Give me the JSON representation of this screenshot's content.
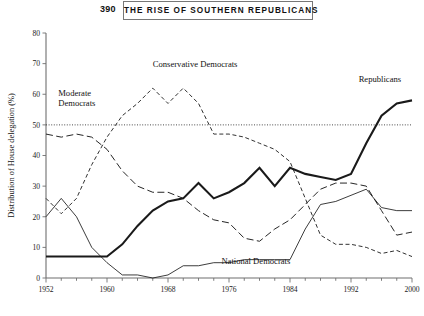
{
  "page": {
    "folio": "390",
    "running_title": "THE RISE OF SOUTHERN REPUBLICANS"
  },
  "chart_data": {
    "type": "line",
    "title": "",
    "xlabel": "",
    "ylabel": "Distribution of House delegation (%)",
    "xlim": [
      1952,
      2000
    ],
    "ylim": [
      0,
      80
    ],
    "grid": false,
    "legend_position": "inline-annotations",
    "xticks": [
      1952,
      1960,
      1968,
      1976,
      1984,
      1992,
      2000
    ],
    "xtick_labels": [
      "1952",
      "1960",
      "1968",
      "1976",
      "1984",
      "1992",
      "2000"
    ],
    "xminor_tick_step": 2,
    "yticks": [
      0,
      10,
      20,
      30,
      40,
      50,
      60,
      70,
      80
    ],
    "ytick_labels": [
      "0",
      "10",
      "20",
      "30",
      "40",
      "50",
      "60",
      "70",
      "80"
    ],
    "reference_lines": [
      {
        "name": "fifty-percent-line",
        "axis": "y",
        "value": 50,
        "style": "dotted"
      }
    ],
    "annotations": [
      {
        "name": "moderate-democrats-label",
        "text": "Moderate\nDemocrats",
        "x": 1953.6,
        "y": 59.5
      },
      {
        "name": "conservative-democrats-label",
        "text": "Conservative Democrats",
        "x": 1966.0,
        "y": 69.0
      },
      {
        "name": "republicans-label",
        "text": "Republicans",
        "x": 1993.0,
        "y": 64.0
      },
      {
        "name": "national-democrats-label",
        "text": "National Democrats",
        "x": 1975.0,
        "y": 4.6
      }
    ],
    "x": [
      1952,
      1954,
      1956,
      1958,
      1960,
      1962,
      1964,
      1966,
      1968,
      1970,
      1972,
      1974,
      1976,
      1978,
      1980,
      1982,
      1984,
      1986,
      1988,
      1990,
      1992,
      1994,
      1996,
      1998,
      2000
    ],
    "series": [
      {
        "name": "Republicans",
        "style": "thick-solid",
        "values": [
          7,
          7,
          7,
          7,
          7,
          11,
          17,
          22,
          25,
          26,
          31,
          26,
          28,
          31,
          36,
          30,
          36,
          34,
          33,
          32,
          34,
          44,
          53,
          57,
          58
        ]
      },
      {
        "name": "Conservative Democrats",
        "style": "short-dash",
        "values": [
          26,
          21,
          26,
          37,
          46,
          53,
          57,
          62,
          57,
          62,
          57,
          47,
          47,
          46,
          44,
          42,
          38,
          26,
          14,
          11,
          11,
          10,
          8,
          9,
          7
        ]
      },
      {
        "name": "Moderate Democrats",
        "style": "long-dash",
        "values": [
          47,
          46,
          47,
          46,
          42,
          35,
          30,
          28,
          28,
          26,
          22,
          19,
          18,
          13,
          12,
          16,
          19,
          24,
          29,
          31,
          31,
          30,
          22,
          14,
          15
        ]
      },
      {
        "name": "National Democrats",
        "style": "thin-solid",
        "values": [
          20,
          26,
          20,
          10,
          5,
          1,
          1,
          0,
          1,
          4,
          4,
          5,
          5,
          6,
          6,
          6,
          6,
          16,
          24,
          25,
          27,
          29,
          23,
          22,
          22
        ]
      }
    ]
  }
}
